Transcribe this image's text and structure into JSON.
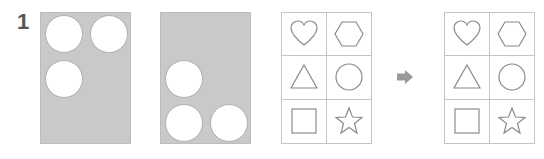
{
  "puzzle": {
    "number": "1",
    "panels": [
      {
        "id": "panel-a",
        "holes": [
          "top-left",
          "top-right",
          "middle-left"
        ]
      },
      {
        "id": "panel-b",
        "holes": [
          "middle-left",
          "bottom-left",
          "bottom-right"
        ]
      }
    ],
    "grids": [
      {
        "id": "shape-grid-question",
        "cells": [
          "heart",
          "hexagon",
          "triangle",
          "circle",
          "square",
          "star"
        ]
      },
      {
        "id": "shape-grid-answer",
        "cells": [
          "heart",
          "hexagon",
          "triangle",
          "circle",
          "square",
          "star"
        ]
      }
    ],
    "arrow_icon": "arrow-right-icon",
    "colors": {
      "panel_fill": "#c9c9c9",
      "hole_fill": "#ffffff",
      "grid_line": "#c4c4c4",
      "shape_stroke": "#8a8a8a",
      "arrow": "#9a9a9a",
      "number": "#555555"
    }
  }
}
